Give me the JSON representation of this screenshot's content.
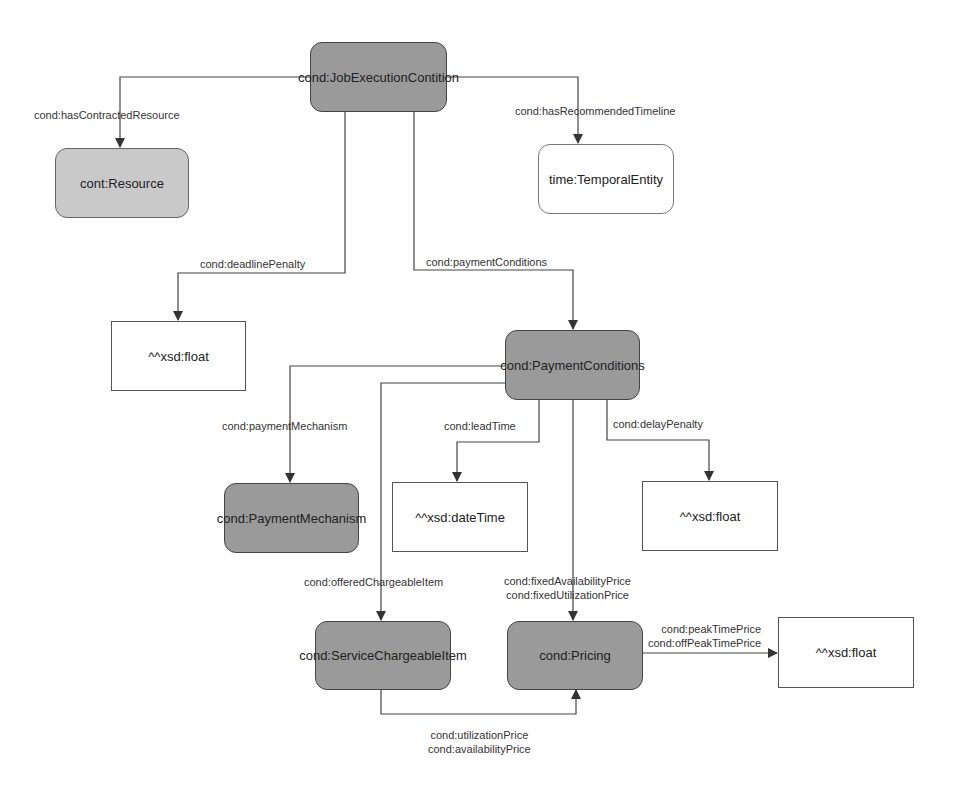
{
  "nodes": {
    "job_execution_condition": "cond:JobExecutionContition",
    "resource": "cont:Resource",
    "temporal_entity": "time:TemporalEntity",
    "deadline_float": "^^xsd:float",
    "payment_conditions": "cond:PaymentConditions",
    "payment_mechanism": "cond:PaymentMechanism",
    "lead_datetime": "^^xsd:dateTime",
    "delay_float": "^^xsd:float",
    "service_chargeable_item": "cond:ServiceChargeableItem",
    "pricing": "cond:Pricing",
    "pricing_float": "^^xsd:float"
  },
  "edges": {
    "has_contracted_resource": "cond:hasContractedResource",
    "has_recommended_timeline": "cond:hasRecommendedTimeline",
    "deadline_penalty": "cond:deadlinePenalty",
    "payment_conditions": "cond:paymentConditions",
    "payment_mechanism": "cond:paymentMechanism",
    "lead_time": "cond:leadTime",
    "delay_penalty": "cond:delayPenalty",
    "offered_chargeable_item": "cond:offeredChargeableItem",
    "fixed_availability_price": "cond:fixedAvailabilityPrice",
    "fixed_utilization_price": "cond:fixedUtilizationPrice",
    "peak_time_price": "cond:peakTimePrice",
    "off_peak_time_price": "cond:offPeakTimePrice",
    "utilization_price": "cond:utilizationPrice",
    "availability_price": "cond:availabilityPrice"
  },
  "colors": {
    "class_dark": "#9a9a9a",
    "class_light": "#c9c9c9",
    "literal": "#ffffff",
    "line": "#444444"
  }
}
